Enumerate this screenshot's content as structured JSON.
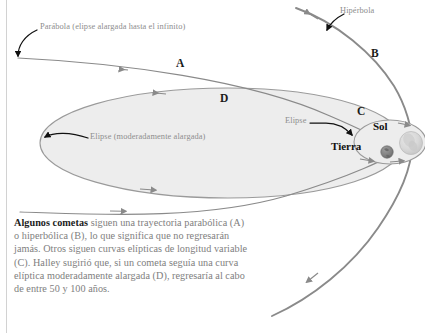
{
  "figure": {
    "title_alt": "Trayectorias de los cometas",
    "background_color": "#ffffff",
    "curve_color": "#8a8a8a",
    "ellipse_fill": "#ededed",
    "ellipse_stroke": "#9a9a9a",
    "annotation_color": "#8d8d8d",
    "marker_color": "#1a1a1a",
    "caption_color": "#7e7e7e"
  },
  "annotations": {
    "parabola": "Parábola (elipse alargada hasta el infinito)",
    "hyperbola": "Hipérbola",
    "ellipse_moderate": "Elipse (moderadamente alargada)",
    "ellipse_short": "Elipse"
  },
  "markers": {
    "a": "A",
    "b": "B",
    "c": "C",
    "d": "D"
  },
  "bodies": {
    "sun": "Sol",
    "earth": "Tierra"
  },
  "caption": {
    "lead": "Algunos cometas",
    "rest": " siguen una trayectoria parabólica (A) o hiperbólica (B), lo que significa que no regresarán jamás. Otros siguen curvas elípticas de longitud variable (C). Halley sugirió que, si un cometa seguía una curva elíptica moderadamente alargada (D), regresaría al cabo de entre 50 y 100 años."
  }
}
